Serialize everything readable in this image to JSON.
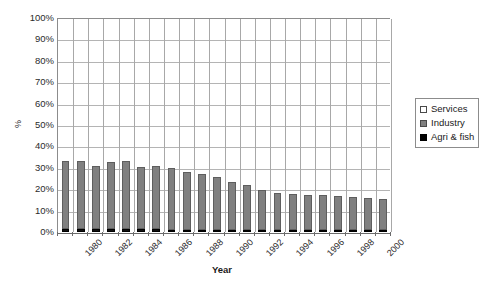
{
  "chart_data": {
    "type": "bar",
    "subtype": "stacked-bar-percent",
    "title": "",
    "xlabel": "Year",
    "ylabel": "%",
    "ylim": [
      0,
      100
    ],
    "yticks": [
      "0%",
      "10%",
      "20%",
      "30%",
      "40%",
      "50%",
      "60%",
      "70%",
      "80%",
      "90%",
      "100%"
    ],
    "ytick_values": [
      0,
      10,
      20,
      30,
      40,
      50,
      60,
      70,
      80,
      90,
      100
    ],
    "grid": "horizontal-and-vertical",
    "legend_position": "right",
    "categories": [
      "1980",
      "1981",
      "1982",
      "1983",
      "1984",
      "1985",
      "1986",
      "1987",
      "1988",
      "1989",
      "1990",
      "1991",
      "1992",
      "1993",
      "1994",
      "1995",
      "1996",
      "1997",
      "1998",
      "1999",
      "2000",
      "2001"
    ],
    "xtick_labels_shown": [
      "1980",
      "1982",
      "1984",
      "1986",
      "1988",
      "1990",
      "1992",
      "1994",
      "1996",
      "1998",
      "2000"
    ],
    "series": [
      {
        "name": "Agri & fish",
        "color": "#000000",
        "values": [
          1.5,
          1.5,
          1.4,
          1.5,
          1.3,
          1.2,
          1.2,
          1.1,
          1.1,
          1.0,
          1.0,
          1.0,
          0.9,
          0.9,
          0.8,
          0.8,
          0.8,
          0.7,
          0.7,
          0.7,
          0.6,
          0.6
        ]
      },
      {
        "name": "Industry",
        "color": "#808080",
        "values": [
          31.5,
          31.5,
          29.6,
          31.0,
          31.7,
          29.3,
          29.8,
          28.9,
          26.9,
          26.0,
          24.5,
          22.0,
          20.6,
          18.6,
          17.2,
          16.7,
          16.2,
          16.3,
          15.8,
          15.3,
          14.9,
          14.4
        ]
      },
      {
        "name": "Services",
        "color": "#ffffff",
        "values": [
          67.0,
          67.0,
          69.0,
          67.5,
          67.0,
          69.5,
          69.0,
          70.0,
          72.0,
          73.0,
          74.5,
          77.0,
          78.5,
          80.5,
          82.0,
          82.5,
          83.0,
          83.0,
          83.5,
          84.0,
          84.5,
          85.0
        ]
      }
    ]
  },
  "legend": {
    "items": [
      {
        "label": "Services",
        "swatch": "services-swatch"
      },
      {
        "label": "Industry",
        "swatch": "industry-swatch"
      },
      {
        "label": "Agri & fish",
        "swatch": "agri-swatch"
      }
    ]
  },
  "axes": {
    "y_title": "%",
    "x_title": "Year"
  }
}
